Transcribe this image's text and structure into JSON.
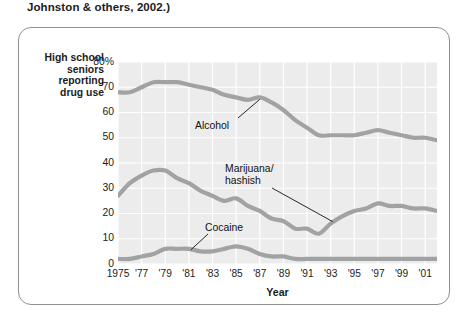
{
  "caption": "Johnston & others, 2002.)",
  "axis": {
    "y_title": "High school\nseniors\nreporting\ndrug use",
    "x_title": "Year"
  },
  "series_labels": {
    "alcohol": "Alcohol",
    "marijuana": "Marijuana/\nhashish",
    "cocaine": "Cocaine"
  },
  "colors": {
    "line": "#a0a2a4",
    "plot_background": "#ececec",
    "gridline": "#ffffff",
    "frame": "#8e9095",
    "text": "#1b1b1b"
  },
  "chart_data": {
    "type": "line",
    "title": "",
    "subtitle": "",
    "xlabel": "Year",
    "ylabel": "High school seniors reporting drug use",
    "xlim": [
      1975,
      2002
    ],
    "ylim": [
      0,
      80
    ],
    "grid": true,
    "legend": "inline-annotations",
    "ytick_labels": [
      "80%",
      "70",
      "60",
      "50",
      "40",
      "30",
      "20",
      "10",
      "0"
    ],
    "ytick_values": [
      80,
      70,
      60,
      50,
      40,
      30,
      20,
      10,
      0
    ],
    "xtick_labels": [
      "1975",
      "'77",
      "'79",
      "'81",
      "'83",
      "'85",
      "'87",
      "'89",
      "'91",
      "'93",
      "'95",
      "'97",
      "'99",
      "'01"
    ],
    "xtick_values": [
      1975,
      1977,
      1979,
      1981,
      1983,
      1985,
      1987,
      1989,
      1991,
      1993,
      1995,
      1997,
      1999,
      2001
    ],
    "x": [
      1975,
      1976,
      1977,
      1978,
      1979,
      1980,
      1981,
      1982,
      1983,
      1984,
      1985,
      1986,
      1987,
      1988,
      1989,
      1990,
      1991,
      1992,
      1993,
      1994,
      1995,
      1996,
      1997,
      1998,
      1999,
      2000,
      2001,
      2002
    ],
    "series": [
      {
        "name": "Alcohol",
        "values": [
          68,
          68,
          70,
          72,
          72,
          72,
          71,
          70,
          69,
          67,
          66,
          65,
          66,
          64,
          61,
          57,
          54,
          51,
          51,
          51,
          51,
          52,
          53,
          52,
          51,
          50,
          50,
          49
        ]
      },
      {
        "name": "Marijuana/hashish",
        "values": [
          27,
          32,
          35,
          37,
          37,
          34,
          32,
          29,
          27,
          25,
          26,
          23,
          21,
          18,
          17,
          14,
          14,
          12,
          16,
          19,
          21,
          22,
          24,
          23,
          23,
          22,
          22,
          21
        ]
      },
      {
        "name": "Cocaine",
        "values": [
          2,
          2,
          3,
          4,
          6,
          6,
          6,
          5,
          5,
          6,
          7,
          6,
          4,
          3,
          3,
          2,
          2,
          2,
          2,
          2,
          2,
          2,
          2,
          2,
          2,
          2,
          2,
          2
        ]
      }
    ],
    "annotations": [
      {
        "text": "Alcohol",
        "points_to_year": 1987,
        "points_to_value": 66
      },
      {
        "text": "Marijuana/hashish",
        "points_to_year": 1993,
        "points_to_value": 16
      },
      {
        "text": "Cocaine",
        "points_to_year": 1981,
        "points_to_value": 6
      }
    ]
  }
}
